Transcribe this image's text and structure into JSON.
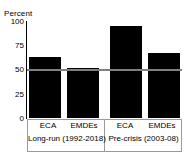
{
  "title_fragment": "",
  "chart_data": {
    "type": "bar",
    "title": "",
    "xlabel": "",
    "ylabel": "Percent",
    "ylim": [
      0,
      100
    ],
    "yticks": [
      100,
      75,
      50,
      25,
      0
    ],
    "ytick_labels": [
      "100",
      "75",
      "50",
      "25",
      "0"
    ],
    "grid": false,
    "legend": "none",
    "bar_color": "#000000",
    "reference_line": {
      "value": 50,
      "color": "#808080",
      "label": ""
    },
    "categories": [
      "ECA",
      "EMDEs",
      "ECA",
      "EMDEs"
    ],
    "values": [
      63,
      52,
      95,
      67
    ],
    "groups": [
      {
        "label": "Long-run (1992-2018)",
        "categories": [
          "ECA",
          "EMDEs"
        ]
      },
      {
        "label": "Pre-crisis (2003-08)",
        "categories": [
          "ECA",
          "EMDEs"
        ]
      }
    ]
  }
}
